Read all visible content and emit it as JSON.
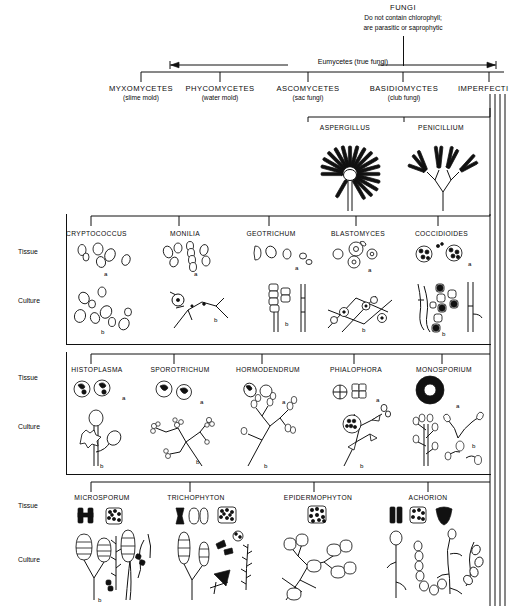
{
  "title": {
    "heading": "FUNGI",
    "line1": "Do not contain chlorophyll;",
    "line2": "are parasitic or saprophytic"
  },
  "group_label": "Eumycetes (true fungi)",
  "classes": [
    {
      "name": "MYXOMYCETES",
      "common": "(slime mold)"
    },
    {
      "name": "PHYCOMYCETES",
      "common": "(water mold)"
    },
    {
      "name": "ASCOMYCETES",
      "common": "(sac fungi)"
    },
    {
      "name": "BASIDIOMYCTES",
      "common": "(club fungi)"
    },
    {
      "name": "IMPERFECTI",
      "common": ""
    }
  ],
  "ascomycete_genera": [
    {
      "name": "ASPERGILLUS"
    },
    {
      "name": "PENICILLIUM"
    }
  ],
  "row_labels": {
    "tissue": "Tissue",
    "culture": "Culture"
  },
  "cell_markers": {
    "tissue": "a",
    "culture": "b"
  },
  "rows": [
    {
      "id": "row-yeasts-systemic",
      "genera": [
        {
          "name": "CRYPTOCOCCUS"
        },
        {
          "name": "MONILIA"
        },
        {
          "name": "GEOTRICHUM"
        },
        {
          "name": "BLASTOMYCES"
        },
        {
          "name": "COCCIDIOIDES"
        }
      ]
    },
    {
      "id": "row-systemic-subcutaneous",
      "genera": [
        {
          "name": "HISTOPLASMA"
        },
        {
          "name": "SPOROTRICHUM"
        },
        {
          "name": "HORMODENDRUM"
        },
        {
          "name": "PHIALOPHORA"
        },
        {
          "name": "MONOSPORIUM"
        }
      ]
    },
    {
      "id": "row-dermatophytes",
      "genera": [
        {
          "name": "MICROSPORUM"
        },
        {
          "name": "TRICHOPHYTON"
        },
        {
          "name": "EPIDERMOPHYTON"
        },
        {
          "name": "ACHORION"
        }
      ]
    }
  ],
  "colors": {
    "ink": "#111111",
    "paper": "#ffffff"
  }
}
